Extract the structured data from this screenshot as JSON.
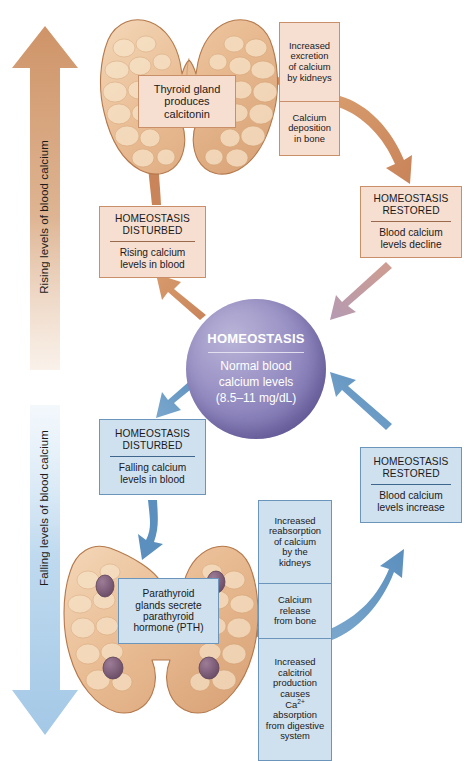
{
  "diagram": {
    "center": {
      "name": "HOMEOSTASIS",
      "body": "Normal blood calcium levels (8.5–11 mg/dL)",
      "body_line1": "Normal blood",
      "body_line2": "calcium levels",
      "body_line3": "(8.5–11 mg/dL)",
      "color": "#8a82bd"
    },
    "trend_arrows": [
      {
        "id": "rising",
        "label": "Rising levels of blood calcium",
        "direction": "up",
        "color": "#d6a078"
      },
      {
        "id": "falling",
        "label": "Falling levels of blood calcium",
        "direction": "down",
        "color": "#a8c8e4"
      }
    ],
    "upper_loop": {
      "accent": "#c98f68",
      "fill": "#f6ded1",
      "disturbed": {
        "title_line1": "HOMEOSTASIS",
        "title_line2": "DISTURBED",
        "body_line1": "Rising calcium",
        "body_line2": "levels in blood"
      },
      "organ": {
        "name": "thyroid-gland",
        "caption_line1": "Thyroid gland",
        "caption_line2": "produces",
        "caption_line3": "calcitonin"
      },
      "effects": [
        {
          "lines": [
            "Increased",
            "excretion",
            "of calcium",
            "by kidneys"
          ]
        },
        {
          "lines": [
            "Calcium",
            "deposition",
            "in bone"
          ]
        }
      ],
      "restored": {
        "title_line1": "HOMEOSTASIS",
        "title_line2": "RESTORED",
        "body_line1": "Blood calcium",
        "body_line2": "levels decline"
      }
    },
    "lower_loop": {
      "accent": "#6b95bb",
      "fill": "#cfe0ef",
      "disturbed": {
        "title_line1": "HOMEOSTASIS",
        "title_line2": "DISTURBED",
        "body_line1": "Falling calcium",
        "body_line2": "levels in blood"
      },
      "organ": {
        "name": "parathyroid-glands",
        "caption_line1": "Parathyroid",
        "caption_line2": "glands secrete",
        "caption_line3": "parathyroid",
        "caption_line4": "hormone (PTH)"
      },
      "effects": [
        {
          "lines": [
            "Increased",
            "reabsorption",
            "of calcium",
            "by the",
            "kidneys"
          ]
        },
        {
          "lines": [
            "Calcium",
            "release",
            "from bone"
          ]
        },
        {
          "lines": [
            "Increased",
            "calcitriol",
            "production",
            "causes",
            "Ca2+",
            "absorption",
            "from digestive",
            "system"
          ]
        }
      ],
      "restored": {
        "title_line1": "HOMEOSTASIS",
        "title_line2": "RESTORED",
        "body_line1": "Blood calcium",
        "body_line2": "levels increase"
      }
    }
  }
}
